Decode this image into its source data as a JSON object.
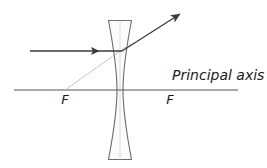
{
  "diagram": {
    "canvas": {
      "width": 267,
      "height": 168,
      "background": "#ffffff"
    },
    "colors": {
      "line": "#555555",
      "ray": "#3b3b3b",
      "lens_outline": "#6b6b6b",
      "lens_fill": "#fbfbfb",
      "construction": "#b0b0b0",
      "text": "#1a1a1a"
    },
    "labels": {
      "focal_point_left": "F",
      "focal_point_right": "F",
      "principal_axis": "Principal axis"
    },
    "principal_axis": {
      "x1": 14,
      "y1": 90,
      "x2": 238,
      "y2": 90
    },
    "lens": {
      "type": "biconcave-diverging",
      "center_x": 120,
      "top_y": 20,
      "bottom_y": 160,
      "edge_half_width": 11.5,
      "waist_half_width": 3.0
    },
    "incident_ray": {
      "x1": 30,
      "y1": 51,
      "x2": 122,
      "y2": 51,
      "arrow_x": 98,
      "arrow_y": 51
    },
    "refracted_ray": {
      "x1": 122,
      "y1": 51,
      "x2": 181,
      "y2": 13
    },
    "construction_ray": {
      "x1": 65,
      "y1": 90,
      "x2": 130,
      "y2": 44,
      "style": "dotted"
    },
    "focal_marks": {
      "left_x": 65,
      "right_x": 170,
      "label_y": 104
    },
    "axis_label_position": {
      "x": 172,
      "y": 80
    }
  }
}
